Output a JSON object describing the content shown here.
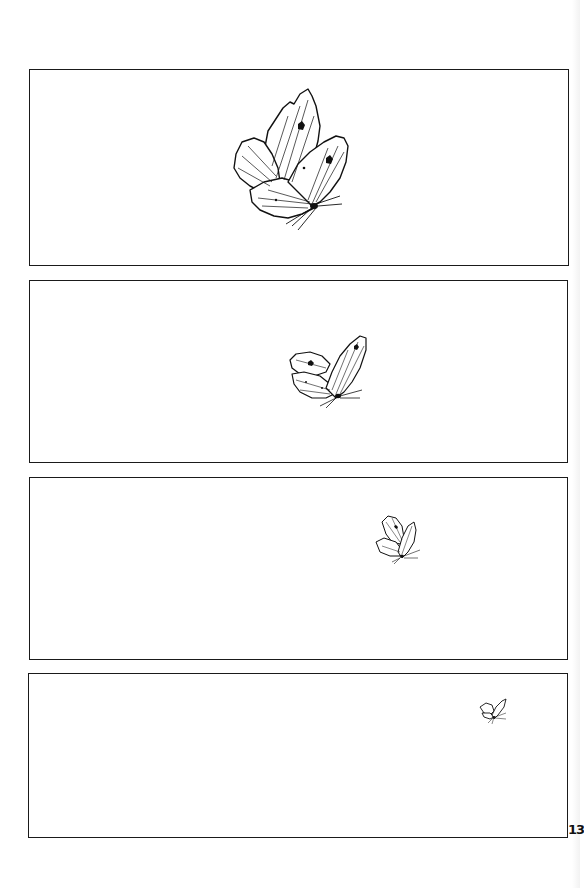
{
  "page": {
    "type": "comic-page",
    "page_number": "13",
    "background_color": "#ffffff",
    "line_color": "#1a1a1a"
  },
  "panels": [
    {
      "id": 1,
      "x": 29,
      "y": 69,
      "w": 540,
      "h": 197,
      "subject": "butterfly",
      "butterfly": {
        "x": 230,
        "y": 88,
        "w": 122,
        "h": 142
      }
    },
    {
      "id": 2,
      "x": 29,
      "y": 280,
      "w": 539,
      "h": 183,
      "subject": "butterfly",
      "butterfly": {
        "x": 287,
        "y": 333,
        "w": 82,
        "h": 75
      }
    },
    {
      "id": 3,
      "x": 29,
      "y": 477,
      "w": 539,
      "h": 183,
      "subject": "butterfly",
      "butterfly": {
        "x": 374,
        "y": 512,
        "w": 48,
        "h": 55
      }
    },
    {
      "id": 4,
      "x": 28,
      "y": 673,
      "w": 540,
      "h": 165,
      "subject": "butterfly",
      "butterfly": {
        "x": 478,
        "y": 697,
        "w": 30,
        "h": 27
      }
    }
  ]
}
